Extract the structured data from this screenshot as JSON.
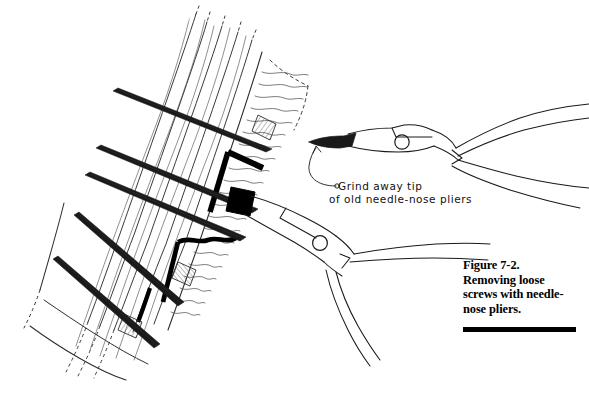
{
  "figure": {
    "caption": {
      "number_line": "Figure 7-2.",
      "line_1": "Removing loose",
      "line_2": "screws with needle-",
      "line_3": "nose pliers.",
      "full_text": "Figure 7-2. Removing loose screws with needle-nose pliers."
    },
    "annotation": {
      "line_1": "Grind away tip",
      "line_2": "of old needle-nose pliers",
      "full_text": "Grind away tip of old needle-nose pliers"
    },
    "colors": {
      "ink": "#000000",
      "background": "#ffffff",
      "grain_line": "#3a3a3a",
      "screw_fill": "#000000",
      "hatch": "#555555"
    },
    "elements": {
      "board_label": "planking boards shown at diagonal angle",
      "screw_label": "loose wood screw",
      "screw_head_label": "screw head gripped by pliers",
      "joint_label": "black joint gap between planks",
      "hole_label": "cross-hatched screw hole",
      "pliers_upper_label": "needle-nose pliers with ground-away tip",
      "pliers_lower_label": "needle-nose pliers gripping screw head",
      "pivot_label": "pliers pivot rivet",
      "arrow_label": "curved leader arrow to pliers tip"
    }
  }
}
